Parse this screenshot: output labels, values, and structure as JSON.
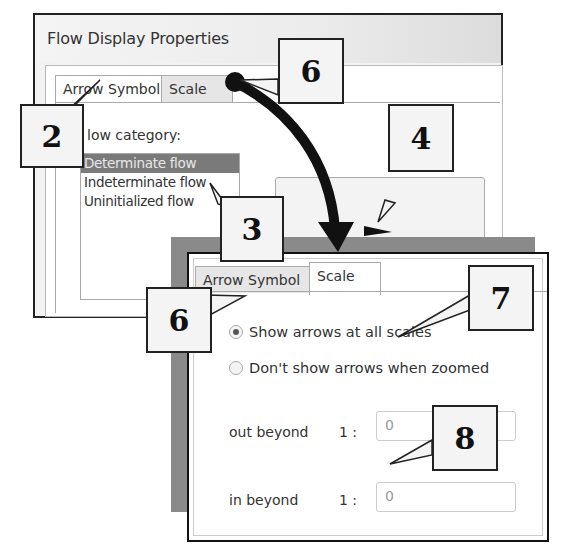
{
  "dialog_back": {
    "title": "Flow Display Properties",
    "tabs": [
      {
        "label": "Arrow Symbol",
        "active": true
      },
      {
        "label": "Scale",
        "active": false
      }
    ],
    "flow_category_label": "Flow category:",
    "flow_category_label_visible": "low category:",
    "flow_categories": [
      {
        "label": "Determinate flow",
        "selected": true
      },
      {
        "label": "Indeterminate flow",
        "selected": false
      },
      {
        "label": "Uninitialized flow",
        "selected": false
      }
    ]
  },
  "dialog_front": {
    "tabs": [
      {
        "label": "Arrow Symbol",
        "active": false
      },
      {
        "label": "Scale",
        "active": true
      }
    ],
    "radio_options": [
      {
        "label": "Show arrows at all scales",
        "checked": true
      },
      {
        "label": "Don't show arrows when zoomed",
        "checked": false
      }
    ],
    "fields": [
      {
        "label": "out beyond",
        "prefix": "1 :",
        "value": "0"
      },
      {
        "label": "in beyond",
        "prefix": "1 :",
        "value": "0"
      }
    ]
  },
  "callouts": {
    "c2": "2",
    "c3": "3",
    "c4": "4",
    "c6a": "6",
    "c6b": "6",
    "c7": "7",
    "c8": "8"
  },
  "colors": {
    "selection": "#7a7a7a",
    "shadow": "#8a8a8a",
    "callout_bg": "#f4f4f4"
  }
}
